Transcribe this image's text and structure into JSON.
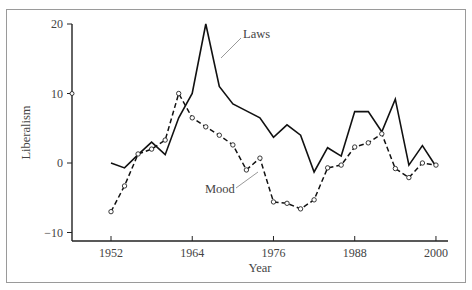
{
  "chart_data": {
    "type": "line",
    "title": "",
    "xlabel": "Year",
    "ylabel": "Liberalism",
    "xlim": [
      1946,
      2002
    ],
    "ylim": [
      -11,
      20
    ],
    "x_ticks": [
      1952,
      1964,
      1976,
      1988,
      2000
    ],
    "y_ticks": [
      -10,
      0,
      10,
      20
    ],
    "grid": false,
    "legend": "inline annotations",
    "x": [
      1952,
      1954,
      1956,
      1958,
      1960,
      1962,
      1964,
      1966,
      1968,
      1970,
      1972,
      1974,
      1976,
      1978,
      1980,
      1982,
      1984,
      1986,
      1988,
      1990,
      1992,
      1994,
      1996,
      1998,
      2000
    ],
    "series": [
      {
        "name": "Laws",
        "style": "solid",
        "values": [
          0,
          -0.7,
          1.2,
          3,
          1.2,
          6.5,
          10,
          20,
          11,
          8.5,
          7.5,
          6.5,
          3.7,
          5.5,
          4,
          -1.3,
          2.2,
          1,
          7.4,
          7.4,
          4.5,
          9.2,
          -0.3,
          2.5,
          -0.5
        ]
      },
      {
        "name": "Mood",
        "style": "dashed with circle markers",
        "values": [
          -7,
          -3.3,
          1.3,
          2,
          3.3,
          10,
          6.5,
          5.2,
          4,
          2.6,
          -1,
          0.7,
          -5.6,
          -5.8,
          -6.6,
          -5.3,
          -0.7,
          -0.3,
          2.3,
          2.9,
          4.2,
          -0.8,
          -2.1,
          0,
          -0.3
        ]
      }
    ],
    "annotations": [
      {
        "text": "Laws",
        "points_to": "Laws"
      },
      {
        "text": "Mood",
        "points_to": "Mood"
      }
    ]
  }
}
